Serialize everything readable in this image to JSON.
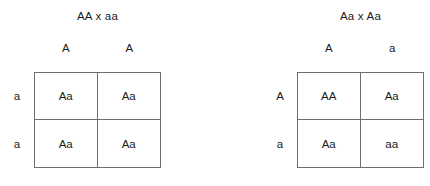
{
  "diagram": {
    "line_color": "#6e6e6e",
    "text_color": "#1a1a1a",
    "background_color": "#ffffff"
  },
  "squares": [
    {
      "cross_label": "AA x aa",
      "column_headers": [
        "A",
        "A"
      ],
      "row_labels": [
        "a",
        "a"
      ],
      "cells": [
        [
          "Aa",
          "Aa"
        ],
        [
          "Aa",
          "Aa"
        ]
      ]
    },
    {
      "cross_label": "Aa x Aa",
      "column_headers": [
        "A",
        "a"
      ],
      "row_labels": [
        "A",
        "a"
      ],
      "cells": [
        [
          "AA",
          "Aa"
        ],
        [
          "Aa",
          "aa"
        ]
      ]
    }
  ]
}
